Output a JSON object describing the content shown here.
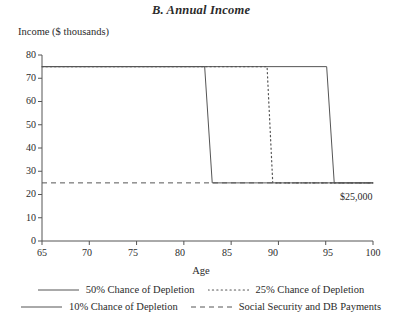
{
  "chart_data": {
    "type": "line",
    "title": "B. Annual Income",
    "xlabel": "Age",
    "ylabel": "Income ($ thousands)",
    "xlim": [
      65,
      100
    ],
    "ylim": [
      0,
      80
    ],
    "xticks": [
      "65",
      "70",
      "75",
      "80",
      "85",
      "90",
      "95",
      "100"
    ],
    "yticks": [
      "0",
      "10",
      "20",
      "30",
      "40",
      "50",
      "60",
      "70",
      "80"
    ],
    "grid": false,
    "legend_position": "below",
    "annotations": [
      {
        "text": "$25,000",
        "x": 97.5,
        "y": 21
      }
    ],
    "series": [
      {
        "name": "50% Chance of Depletion",
        "style": "solid",
        "color": "#555555",
        "x": [
          65,
          82.2,
          83.0,
          100
        ],
        "values": [
          75,
          75,
          25,
          25
        ]
      },
      {
        "name": "25% Chance of Depletion",
        "style": "dotted",
        "color": "#555555",
        "x": [
          65,
          88.8,
          89.4,
          100
        ],
        "values": [
          75,
          75,
          25,
          25
        ]
      },
      {
        "name": "10% Chance of Depletion",
        "style": "solid",
        "color": "#555555",
        "x": [
          65,
          95.1,
          95.9,
          100
        ],
        "values": [
          75,
          75,
          25,
          25
        ]
      },
      {
        "name": "Social Security and DB Payments",
        "style": "dashed",
        "color": "#555555",
        "x": [
          65,
          100
        ],
        "values": [
          25,
          25
        ]
      }
    ]
  },
  "axis": {
    "y_tick_labels": [
      "80",
      "70",
      "60",
      "50",
      "40",
      "30",
      "20",
      "10",
      "0"
    ],
    "x_tick_labels": [
      "65",
      "70",
      "75",
      "80",
      "85",
      "90",
      "95",
      "100"
    ]
  },
  "legend": {
    "items": [
      {
        "label": "50% Chance of Depletion",
        "style": "solid"
      },
      {
        "label": "25% Chance of Depletion",
        "style": "dotted"
      },
      {
        "label": "10% Chance of Depletion",
        "style": "solid"
      },
      {
        "label": "Social Security and DB Payments",
        "style": "dashed"
      }
    ]
  }
}
